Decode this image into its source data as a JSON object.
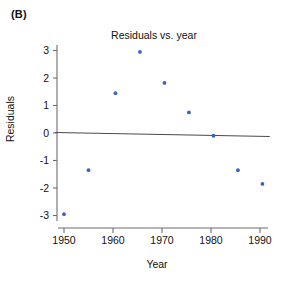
{
  "panel": {
    "label": "(B)"
  },
  "chart_data": {
    "type": "scatter",
    "title": "Residuals vs. year",
    "xlabel": "Year",
    "ylabel": "Residuals",
    "xlim": [
      1948,
      1992
    ],
    "ylim": [
      -3.2,
      3.2
    ],
    "grid": false,
    "legend": null,
    "xticks": [
      1950,
      1960,
      1970,
      1980,
      1990
    ],
    "xtick_labels": [
      "1950",
      "1960",
      "1970",
      "1980",
      "1990"
    ],
    "yticks": [
      3,
      2,
      1,
      0,
      -1,
      -2,
      -3
    ],
    "ytick_labels": [
      "3",
      "2",
      "1",
      "0",
      "-1",
      "-2",
      "-3"
    ],
    "point_color": "#3a62c4",
    "line_color": "#4a4a4a",
    "axis_color": "#6d6d6d",
    "x": [
      1950,
      1955,
      1960.5,
      1965.5,
      1970.5,
      1975.5,
      1980.5,
      1985.5,
      1990.5
    ],
    "y": [
      -2.95,
      -1.35,
      1.45,
      2.95,
      1.82,
      0.75,
      -0.1,
      -1.35,
      -1.85
    ],
    "points": [
      {
        "x": 1950,
        "y": -2.95
      },
      {
        "x": 1955,
        "y": -1.35
      },
      {
        "x": 1960.5,
        "y": 1.45
      },
      {
        "x": 1965.5,
        "y": 2.95
      },
      {
        "x": 1970.5,
        "y": 1.82
      },
      {
        "x": 1975.5,
        "y": 0.75
      },
      {
        "x": 1980.5,
        "y": -0.1
      },
      {
        "x": 1985.5,
        "y": -1.35
      },
      {
        "x": 1990.5,
        "y": -1.85
      }
    ],
    "reference_line": {
      "name": "zero-trend-line",
      "x_start": 1948.2,
      "y_start": 0.02,
      "x_end": 1992.0,
      "y_end": -0.13
    }
  }
}
